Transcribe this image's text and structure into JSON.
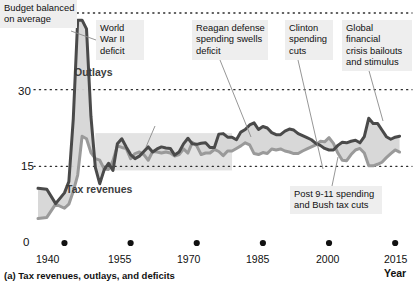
{
  "chart_data": {
    "type": "area",
    "title": "",
    "caption": "(a) Tax revenues, outlays, and deficits",
    "xlabel": "Year",
    "ylabel": "",
    "xlim": [
      1934,
      2017
    ],
    "ylim": [
      0,
      47
    ],
    "yticks": [
      "0",
      "15",
      "30",
      "45"
    ],
    "ytick_values": [
      0,
      15,
      30,
      45
    ],
    "xticks": [
      "1940",
      "1955",
      "1970",
      "1985",
      "2000",
      "2015"
    ],
    "xtick_values": [
      1940,
      1955,
      1970,
      1985,
      2000,
      2015
    ],
    "grid": "dotted-horizontal",
    "legend": "inline-labels",
    "units": "percent of GDP",
    "colors": {
      "outlays": "#4a4a4a",
      "revenues": "#9a9a9a",
      "fill": "#d6d6d6",
      "band": "#d9d9d9",
      "annotation_bg": "#eeeeee",
      "text": "#111111"
    },
    "series": [
      {
        "name": "Outlays",
        "color": "#4a4a4a",
        "x": [
          1934,
          1936,
          1938,
          1940,
          1941,
          1942,
          1943,
          1944,
          1945,
          1946,
          1947,
          1948,
          1949,
          1950,
          1951,
          1952,
          1953,
          1954,
          1955,
          1956,
          1957,
          1958,
          1959,
          1960,
          1961,
          1962,
          1963,
          1964,
          1965,
          1966,
          1967,
          1968,
          1969,
          1970,
          1971,
          1972,
          1973,
          1974,
          1975,
          1976,
          1977,
          1978,
          1979,
          1980,
          1981,
          1982,
          1983,
          1984,
          1985,
          1986,
          1987,
          1988,
          1989,
          1990,
          1991,
          1992,
          1993,
          1994,
          1995,
          1996,
          1997,
          1998,
          1999,
          2000,
          2001,
          2002,
          2003,
          2004,
          2005,
          2006,
          2007,
          2008,
          2009,
          2010,
          2011,
          2012,
          2013,
          2014,
          2015,
          2016
        ],
        "values": [
          10.7,
          10.5,
          7.7,
          9.8,
          12.0,
          24.3,
          43.6,
          43.6,
          41.9,
          24.8,
          14.8,
          11.6,
          14.3,
          15.6,
          14.2,
          19.4,
          20.4,
          18.8,
          17.3,
          16.5,
          17.0,
          17.9,
          18.8,
          17.8,
          18.4,
          18.8,
          18.6,
          18.5,
          17.2,
          17.8,
          19.4,
          20.5,
          19.4,
          19.3,
          19.5,
          19.6,
          18.7,
          18.7,
          21.3,
          21.4,
          20.7,
          20.7,
          20.2,
          21.7,
          22.2,
          23.1,
          23.5,
          22.2,
          22.8,
          22.5,
          21.6,
          21.2,
          21.2,
          21.9,
          22.3,
          22.1,
          21.4,
          21.0,
          20.6,
          20.2,
          19.5,
          19.1,
          18.5,
          18.2,
          18.2,
          19.1,
          19.7,
          19.6,
          19.9,
          20.1,
          19.6,
          20.8,
          24.4,
          23.4,
          23.4,
          22.1,
          20.8,
          20.3,
          20.7,
          20.9
        ]
      },
      {
        "name": "Tax revenues",
        "color": "#9a9a9a",
        "x": [
          1934,
          1936,
          1938,
          1940,
          1941,
          1942,
          1943,
          1944,
          1945,
          1946,
          1947,
          1948,
          1949,
          1950,
          1951,
          1952,
          1953,
          1954,
          1955,
          1956,
          1957,
          1958,
          1959,
          1960,
          1961,
          1962,
          1963,
          1964,
          1965,
          1966,
          1967,
          1968,
          1969,
          1970,
          1971,
          1972,
          1973,
          1974,
          1975,
          1976,
          1977,
          1978,
          1979,
          1980,
          1981,
          1982,
          1983,
          1984,
          1985,
          1986,
          1987,
          1988,
          1989,
          1990,
          1991,
          1992,
          1993,
          1994,
          1995,
          1996,
          1997,
          1998,
          1999,
          2000,
          2001,
          2002,
          2003,
          2004,
          2005,
          2006,
          2007,
          2008,
          2009,
          2010,
          2011,
          2012,
          2013,
          2014,
          2015,
          2016
        ],
        "values": [
          4.8,
          5.0,
          7.6,
          6.8,
          7.6,
          10.1,
          13.3,
          20.9,
          20.4,
          17.7,
          16.5,
          16.2,
          14.5,
          14.4,
          16.1,
          19.0,
          18.7,
          18.5,
          16.5,
          17.5,
          17.8,
          17.3,
          16.2,
          17.9,
          17.8,
          17.6,
          17.8,
          17.6,
          17.0,
          17.3,
          18.4,
          17.6,
          19.7,
          19.0,
          17.3,
          17.6,
          17.6,
          18.3,
          17.9,
          17.1,
          18.0,
          18.0,
          18.5,
          19.0,
          19.6,
          19.2,
          17.5,
          17.3,
          17.7,
          17.5,
          18.4,
          18.2,
          18.4,
          18.0,
          17.8,
          17.5,
          17.5,
          18.0,
          18.4,
          18.8,
          19.2,
          19.9,
          19.8,
          20.6,
          19.5,
          17.6,
          16.2,
          16.1,
          17.3,
          18.2,
          18.5,
          17.6,
          15.1,
          15.1,
          15.4,
          15.8,
          16.7,
          17.5,
          18.2,
          17.8
        ]
      }
    ],
    "band": {
      "label": "budget-balanced-band",
      "x_start": 1947,
      "x_end": 1978,
      "y_low": 14.2,
      "y_high": 21.5
    },
    "series_labels": [
      {
        "name": "outlays-label",
        "text": "Outlays",
        "x": 74,
        "y": 66
      },
      {
        "name": "revenues-label",
        "text": "Tax revenues",
        "x": 66,
        "y": 183
      }
    ],
    "annotations": [
      {
        "id": "ww2",
        "text": "World\nWar II\ndeficit",
        "box": {
          "x": 96,
          "y": 20,
          "w": 48,
          "h": 40
        },
        "leader": {
          "x1": 96,
          "y1": 40,
          "x2": 71,
          "y2": 31
        }
      },
      {
        "id": "reagan",
        "text": "Reagan defense\nspending swells\ndeficit",
        "box": {
          "x": 192,
          "y": 20,
          "w": 76,
          "h": 40
        },
        "leader": {
          "x1": 220,
          "y1": 60,
          "x2": 251,
          "y2": 137
        }
      },
      {
        "id": "clinton",
        "text": "Clinton\nspending\ncuts",
        "box": {
          "x": 285,
          "y": 20,
          "w": 48,
          "h": 40
        },
        "leader": {
          "x1": 298,
          "y1": 60,
          "x2": 323,
          "y2": 169
        }
      },
      {
        "id": "budget-balanced",
        "text": "Budget balanced\non average",
        "box": {
          "x": 124,
          "y": 99,
          "w": 78,
          "h": 27
        },
        "leader": {
          "x1": 155,
          "y1": 126,
          "x2": 146,
          "y2": 147
        }
      },
      {
        "id": "gfc",
        "text": "Global financial\ncrisis bailouts\nand stimulus",
        "box": {
          "x": 342,
          "y": 20,
          "w": 70,
          "h": 40
        },
        "leader": {
          "x1": 366,
          "y1": 60,
          "x2": 383,
          "y2": 121
        }
      },
      {
        "id": "post911",
        "text": "Post 9-11 spending\nand Bush tax cuts",
        "box": {
          "x": 290,
          "y": 186,
          "w": 92,
          "h": 27
        },
        "leader": {
          "x1": 332,
          "y1": 186,
          "x2": 338,
          "y2": 157
        }
      }
    ]
  },
  "axis": {
    "x_axis_title": "Year",
    "y_tick_labels": [
      "45",
      "30",
      "15",
      "0"
    ]
  }
}
